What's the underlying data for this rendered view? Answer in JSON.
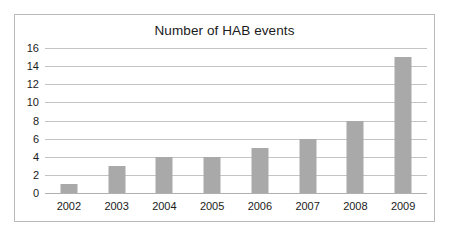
{
  "chart_data": {
    "type": "bar",
    "title": "Number of HAB events",
    "xlabel": "",
    "ylabel": "",
    "categories": [
      "2002",
      "2003",
      "2004",
      "2005",
      "2006",
      "2007",
      "2008",
      "2009"
    ],
    "values": [
      1,
      3,
      4,
      4,
      5,
      6,
      8,
      15
    ],
    "yticks": [
      0,
      2,
      4,
      6,
      8,
      10,
      12,
      14,
      16
    ],
    "ylim": [
      0,
      16
    ],
    "grid": "horizontal",
    "legend": "none",
    "series": [
      {
        "name": "HAB events",
        "values": [
          1,
          3,
          4,
          4,
          5,
          6,
          8,
          15
        ]
      }
    ],
    "colors": {
      "bar_fill": "#a9a9a9",
      "gridline": "#c4c4c4",
      "axis": "#b0b0b0",
      "text": "#1b1b1b",
      "frame_border": "#b9b9b9",
      "background": "#ffffff"
    }
  }
}
